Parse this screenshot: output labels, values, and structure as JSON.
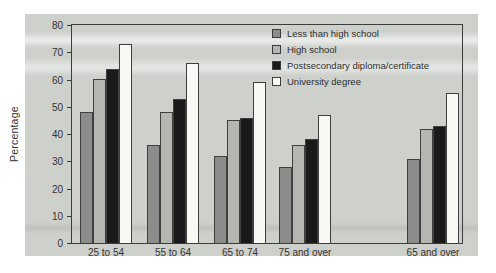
{
  "figure": {
    "page_background": "#ffffff",
    "panel_background": "#cdd0cb",
    "axis_color": "#3c3c3c",
    "text_color": "#2e2e2e"
  },
  "chart_data": {
    "type": "bar",
    "title": "",
    "xlabel": "",
    "ylabel": "Percentage",
    "ylim": [
      0,
      80
    ],
    "yticks": [
      0,
      10,
      20,
      30,
      40,
      50,
      60,
      70,
      80
    ],
    "grid": false,
    "legend_position": "top-right-inside",
    "categories": [
      "25 to 54",
      "55 to 64",
      "65 to 74",
      "75 and over",
      "65 and over"
    ],
    "series": [
      {
        "name": "Less than high school",
        "color": "#8b8d8a",
        "values": [
          48,
          36,
          32,
          28,
          31
        ]
      },
      {
        "name": "High school",
        "color": "#b4b6b2",
        "values": [
          60,
          48,
          45,
          36,
          42
        ]
      },
      {
        "name": "Postsecondary diploma/certificate",
        "color": "#1a1a1a",
        "values": [
          64,
          53,
          46,
          38,
          43
        ]
      },
      {
        "name": "University degree",
        "color": "#f8f8f5",
        "values": [
          73,
          66,
          59,
          47,
          55
        ]
      }
    ]
  }
}
